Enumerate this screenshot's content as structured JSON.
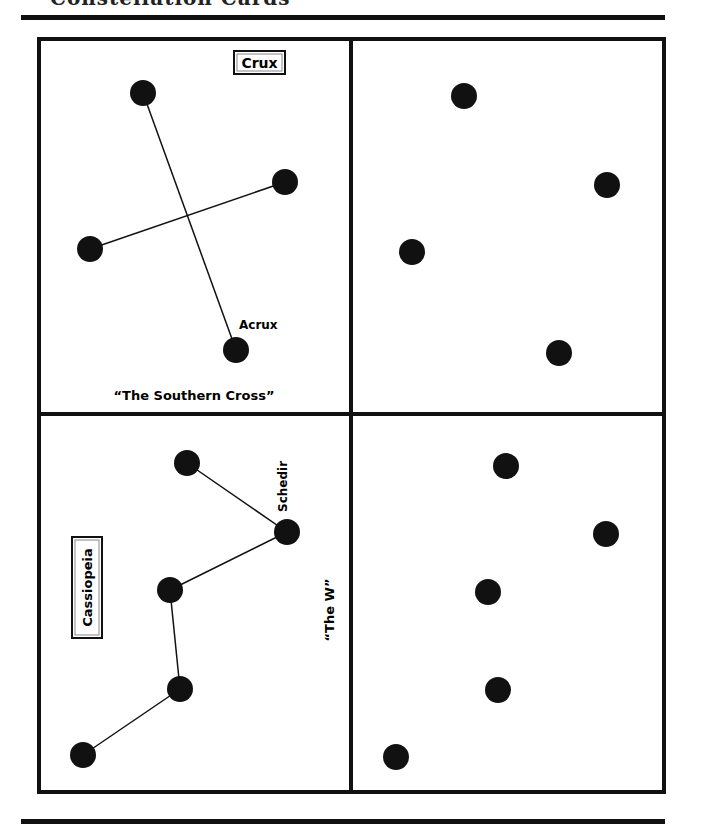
{
  "header": {
    "title": "Constellation Cards"
  },
  "cards": [
    {
      "id": "crux",
      "name_label": "Crux",
      "nickname": "“The Southern Cross”",
      "star_labels": [
        {
          "star_index": 3,
          "text": "Acrux"
        }
      ],
      "stars": [
        [
          143,
          93
        ],
        [
          285,
          182
        ],
        [
          90,
          249
        ],
        [
          236,
          350
        ]
      ],
      "connections": [
        [
          0,
          3
        ],
        [
          2,
          1
        ]
      ],
      "lines_visible": true
    },
    {
      "id": "crux-blank",
      "stars": [
        [
          464,
          96
        ],
        [
          607,
          185
        ],
        [
          412,
          252
        ],
        [
          559,
          353
        ]
      ],
      "connections": [],
      "lines_visible": false
    },
    {
      "id": "cassiopeia",
      "name_label": "Cassiopeia",
      "nickname": "“The W”",
      "star_labels": [
        {
          "star_index": 1,
          "text": "Schedir"
        }
      ],
      "stars": [
        [
          187,
          463
        ],
        [
          287,
          532
        ],
        [
          170,
          590
        ],
        [
          180,
          689
        ],
        [
          83,
          755
        ]
      ],
      "connections": [
        [
          0,
          1
        ],
        [
          1,
          2
        ],
        [
          2,
          3
        ],
        [
          3,
          4
        ]
      ],
      "lines_visible": true
    },
    {
      "id": "cassiopeia-blank",
      "stars": [
        [
          506,
          466
        ],
        [
          606,
          534
        ],
        [
          488,
          592
        ],
        [
          498,
          690
        ],
        [
          396,
          757
        ]
      ],
      "connections": [],
      "lines_visible": false
    }
  ],
  "colors": {
    "ink": "#111111",
    "paper": "#ffffff"
  }
}
